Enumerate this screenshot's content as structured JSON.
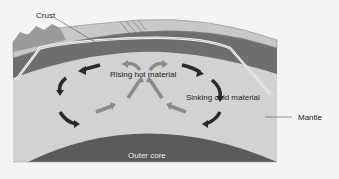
{
  "diagram": {
    "labels": {
      "crust": "Crust",
      "rising": "Rising hot material",
      "sinking": "Sinking cold material",
      "mantle": "Mantle",
      "outer_core": "Outer core"
    },
    "colors": {
      "background": "#f4f4f4",
      "mantle": "#d2d2d2",
      "lithosphere": "#6e6e6e",
      "crust_top": "#c8c8c8",
      "outer_core": "#5a5a5a",
      "dark_arrow": "#2a2a2a",
      "grey_arrow": "#8a8a8a"
    }
  }
}
